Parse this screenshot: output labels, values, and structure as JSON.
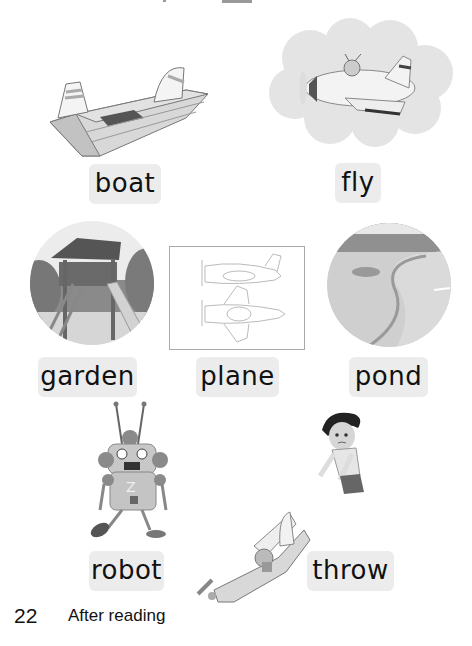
{
  "page": {
    "number": "22",
    "section": "After reading"
  },
  "words": {
    "boat": "boat",
    "fly": "fly",
    "garden": "garden",
    "plane": "plane",
    "pond": "pond",
    "robot": "robot",
    "throw": "throw"
  },
  "images": [
    {
      "name": "boat",
      "icon": "paper-boat-illustration"
    },
    {
      "name": "fly",
      "icon": "plane-flying-in-cloud-illustration"
    },
    {
      "name": "garden",
      "icon": "playground-treehouse-slide-illustration"
    },
    {
      "name": "plane",
      "icon": "paper-plane-outline-drawing"
    },
    {
      "name": "pond",
      "icon": "pond-landscape-illustration"
    },
    {
      "name": "robot",
      "icon": "robot-character-illustration"
    },
    {
      "name": "throw",
      "icon": "boy-throwing-plane-illustration"
    }
  ],
  "colors": {
    "label_bg": "#ececec",
    "text": "#111111"
  }
}
